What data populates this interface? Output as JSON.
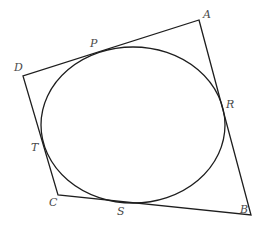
{
  "diagram": {
    "stroke_color": "#1e1e1e",
    "label_color": "#4a4a4a",
    "vertices": {
      "A": {
        "x": 199,
        "y": 20
      },
      "B": {
        "x": 251,
        "y": 215
      },
      "C": {
        "x": 58,
        "y": 195
      },
      "D": {
        "x": 23,
        "y": 76
      }
    },
    "ellipse": {
      "cx": 133,
      "cy": 125,
      "rx": 92,
      "ry": 78
    },
    "labels": [
      {
        "id": "A",
        "text": "A",
        "x": 203,
        "y": 18
      },
      {
        "id": "B",
        "text": "B",
        "x": 240,
        "y": 213
      },
      {
        "id": "C",
        "text": "C",
        "x": 49,
        "y": 206
      },
      {
        "id": "D",
        "text": "D",
        "x": 14,
        "y": 71
      },
      {
        "id": "P",
        "text": "P",
        "x": 90,
        "y": 47
      },
      {
        "id": "R",
        "text": "R",
        "x": 226,
        "y": 108
      },
      {
        "id": "T",
        "text": "T",
        "x": 31,
        "y": 151
      },
      {
        "id": "S",
        "text": "S",
        "x": 117,
        "y": 215
      }
    ]
  }
}
